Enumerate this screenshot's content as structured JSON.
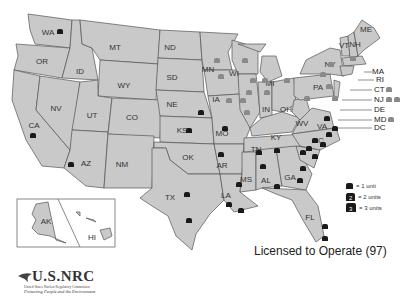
{
  "title_fragment": "Operating Nuclear Power Reactors (partially visible, cut off at top)",
  "map": {
    "states": [
      "WA",
      "OR",
      "CA",
      "ID",
      "NV",
      "MT",
      "WY",
      "UT",
      "AZ",
      "CO",
      "NM",
      "ND",
      "SD",
      "NE",
      "KS",
      "OK",
      "TX",
      "MN",
      "IA",
      "MO",
      "AR",
      "LA",
      "WI",
      "IL",
      "MS",
      "MI",
      "IN",
      "KY",
      "TN",
      "AL",
      "OH",
      "WV",
      "GA",
      "FL",
      "PA",
      "VA",
      "NC",
      "SC",
      "NY",
      "VT",
      "NH",
      "ME",
      "AK",
      "HI"
    ],
    "northeast_labels": [
      "MA",
      "RI",
      "CT",
      "NJ",
      "DE",
      "MD",
      "DC"
    ],
    "colors": {
      "state_fill": "#c9c9c9",
      "state_stroke": "#555555",
      "reactor_dark": "#1a1a1a",
      "reactor_gray": "#8a8a8a"
    }
  },
  "legend": {
    "items": [
      {
        "label": "= 1 unit"
      },
      {
        "label": "= 2 units"
      },
      {
        "label": "= 3 units"
      }
    ]
  },
  "caption": "Licensed to Operate (97)",
  "logo": {
    "name": "U.S.NRC",
    "line1": "United States Nuclear Regulatory Commission",
    "line2": "Protecting People and the Environment"
  }
}
